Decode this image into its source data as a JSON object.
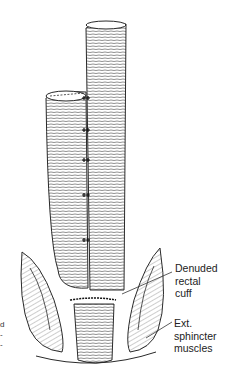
{
  "diagram": {
    "type": "anatomical line illustration",
    "labels": [
      {
        "id": "denuded_rectal_cuff",
        "text": "Denuded\nrectal\ncuff"
      },
      {
        "id": "ext_sphincter_muscles",
        "text": "Ext.\nsphincter\nmuscles"
      },
      {
        "id": "cropped_left_label",
        "text": "d\n-\n-"
      }
    ],
    "colors": {
      "line": "#2a2a2a",
      "background": "#ffffff",
      "text": "#222222"
    }
  }
}
